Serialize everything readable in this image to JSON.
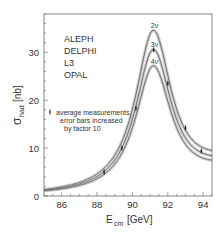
{
  "chart_data": {
    "type": "line",
    "title": "",
    "xlabel": "E_cm [GeV]",
    "xlabel_main": "E",
    "xlabel_sub": "cm",
    "xlabel_unit": "[GeV]",
    "ylabel": "σ_had [nb]",
    "ylabel_main": "σ",
    "ylabel_sub": "had",
    "ylabel_unit": "[nb]",
    "xlim": [
      85,
      94.5
    ],
    "ylim": [
      0,
      38
    ],
    "xticks": [
      86,
      88,
      90,
      92,
      94
    ],
    "yticks": [
      0,
      10,
      20,
      30
    ],
    "grid": false,
    "experiments": [
      "ALEPH",
      "DELPHI",
      "L3",
      "OPAL"
    ],
    "annotation": [
      "average measurements,",
      "error bars increased",
      "by factor 10"
    ],
    "series": [
      {
        "name": "2ν",
        "label": "2ν",
        "peak_x": 91.19,
        "peak_y": 34.6,
        "x": [
          85,
          86,
          87,
          88,
          89,
          90,
          90.5,
          91,
          91.19,
          91.5,
          92,
          93,
          94,
          94.5
        ],
        "values": [
          1.2,
          1.8,
          2.6,
          4.2,
          7.9,
          18.2,
          26.5,
          33.6,
          34.6,
          32.7,
          24.0,
          13.5,
          8.8,
          7.4
        ]
      },
      {
        "name": "3ν",
        "label": "3ν",
        "peak_x": 91.19,
        "peak_y": 30.6,
        "x": [
          85,
          86,
          87,
          88,
          89,
          90,
          90.5,
          91,
          91.19,
          91.5,
          92,
          93,
          94,
          94.5
        ],
        "values": [
          1.2,
          1.7,
          2.5,
          4.0,
          7.4,
          16.9,
          24.2,
          29.8,
          30.6,
          29.0,
          21.8,
          12.6,
          8.3,
          7.0
        ]
      },
      {
        "name": "4ν",
        "label": "4ν",
        "peak_x": 91.19,
        "peak_y": 27.2,
        "x": [
          85,
          86,
          87,
          88,
          89,
          90,
          90.5,
          91,
          91.19,
          91.5,
          92,
          93,
          94,
          94.5
        ],
        "values": [
          1.1,
          1.7,
          2.4,
          3.8,
          7.0,
          15.6,
          22.0,
          26.6,
          27.2,
          25.9,
          19.9,
          11.8,
          7.8,
          6.7
        ]
      }
    ],
    "measurements": {
      "name": "average measurements",
      "x": [
        88.4,
        89.4,
        90.2,
        91.2,
        92.0,
        93.0,
        93.9
      ],
      "values": [
        5.0,
        10.0,
        18.3,
        30.5,
        23.5,
        14.2,
        9.4
      ]
    }
  },
  "colors": {
    "axis": "#555555",
    "curve": "#555555",
    "band": "#cfcfcf",
    "text": "#333333"
  }
}
